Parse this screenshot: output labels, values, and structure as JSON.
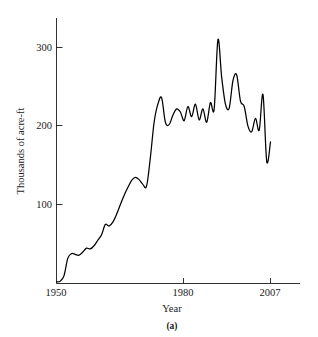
{
  "figure": {
    "caption": "(a)"
  },
  "chart_data": {
    "type": "line",
    "title": "",
    "xlabel": "Year",
    "ylabel": "Thousands of acre-ft",
    "xlim": [
      1950,
      2007
    ],
    "ylim": [
      0,
      330
    ],
    "grid": false,
    "legend": "none",
    "x_ticks": [
      {
        "value": 1950,
        "label": "1950"
      },
      {
        "value": 1980,
        "label": "1980"
      },
      {
        "value": 2007,
        "label": "2007"
      }
    ],
    "y_ticks": [
      {
        "value": 100,
        "label": "100"
      },
      {
        "value": 200,
        "label": "200"
      },
      {
        "value": 300,
        "label": "300"
      }
    ],
    "series": [
      {
        "name": "Storage",
        "color": "#000000",
        "x": [
          1950,
          1951,
          1952,
          1953,
          1954,
          1955,
          1956,
          1957,
          1958,
          1959,
          1960,
          1961,
          1962,
          1963,
          1964,
          1965,
          1966,
          1967,
          1968,
          1969,
          1970,
          1971,
          1972,
          1973,
          1974,
          1975,
          1976,
          1977,
          1978,
          1979,
          1980,
          1981,
          1982,
          1983,
          1984,
          1985,
          1986,
          1987,
          1988,
          1989,
          1990,
          1991,
          1992,
          1993,
          1994,
          1995,
          1996,
          1997,
          1998,
          1999,
          2000,
          2001,
          2002,
          2003,
          2004,
          2005,
          2006,
          2007
        ],
        "values": [
          2,
          3,
          10,
          32,
          38,
          37,
          36,
          40,
          45,
          44,
          48,
          55,
          62,
          75,
          73,
          78,
          88,
          100,
          112,
          122,
          131,
          135,
          132,
          126,
          124,
          160,
          205,
          228,
          236,
          205,
          202,
          214,
          222,
          218,
          207,
          225,
          212,
          228,
          208,
          222,
          205,
          230,
          222,
          310,
          262,
          228,
          223,
          258,
          265,
          232,
          225,
          200,
          193,
          210,
          195,
          240,
          155,
          180
        ]
      }
    ]
  }
}
